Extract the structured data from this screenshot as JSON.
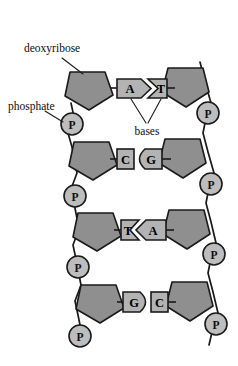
{
  "figure": {
    "background_color": "#ffffff"
  },
  "colors": {
    "sugar_fill": "#8f8f8f",
    "phosphate_fill": "#bdbdbd",
    "base_fill": "#b3b3b3",
    "outline": "#1a1a1a",
    "text": "#0d0d0d"
  },
  "annotations": [
    {
      "id": "deoxyribose",
      "label": "deoxyribose",
      "x": 24,
      "y": 48
    },
    {
      "id": "phosphate",
      "label": "phosphate",
      "x": 8,
      "y": 106
    },
    {
      "id": "bases",
      "label": "bases",
      "x": 147,
      "y": 131
    }
  ],
  "phosphate_label": "P",
  "base_pairs": [
    {
      "left": "A",
      "right": "T",
      "left_shape": "arrow-right",
      "right_shape": "notch-left-box"
    },
    {
      "left": "C",
      "right": "G",
      "left_shape": "small-box",
      "right_shape": "round-left-rect"
    },
    {
      "left": "T",
      "right": "A",
      "left_shape": "notch-right-box",
      "right_shape": "arrow-left"
    },
    {
      "left": "G",
      "right": "C",
      "left_shape": "round-right-rect",
      "right_shape": "small-box"
    }
  ],
  "strands": {
    "left": {
      "name": "left-strand",
      "sugar_count": 4,
      "phosphate_count": 4,
      "sugars": [
        "deoxyribose",
        "deoxyribose",
        "deoxyribose",
        "deoxyribose"
      ],
      "phosphates": [
        "P",
        "P",
        "P",
        "P"
      ]
    },
    "right": {
      "name": "right-strand",
      "sugar_count": 4,
      "phosphate_count": 4,
      "sugars": [
        "deoxyribose",
        "deoxyribose",
        "deoxyribose",
        "deoxyribose"
      ],
      "phosphates": [
        "P",
        "P",
        "P",
        "P"
      ]
    }
  }
}
